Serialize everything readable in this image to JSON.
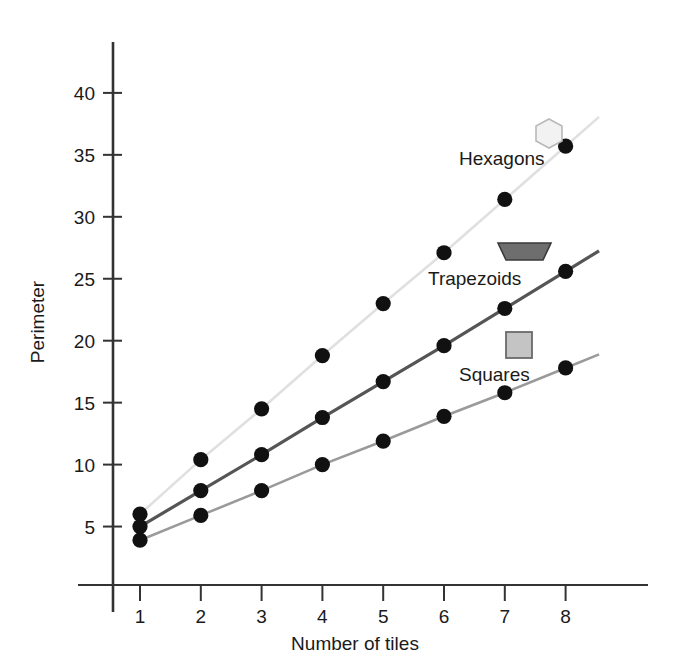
{
  "chart_data": {
    "type": "line",
    "title": "",
    "xlabel": "Number of tiles",
    "ylabel": "Perimeter",
    "x": [
      1,
      2,
      3,
      4,
      5,
      6,
      7,
      8
    ],
    "xticklabels": [
      "1",
      "2",
      "3",
      "4",
      "5",
      "6",
      "7",
      "8"
    ],
    "yticklabels": [
      "5",
      "10",
      "15",
      "20",
      "25",
      "30",
      "35",
      "40"
    ],
    "yticks": [
      5,
      10,
      15,
      20,
      25,
      30,
      35,
      40
    ],
    "xlim": [
      0.45,
      8.6
    ],
    "ylim": [
      0,
      43
    ],
    "grid": false,
    "legend_position": "inline-right",
    "series": [
      {
        "name": "Hexagons",
        "marker": "hexagon",
        "marker_fill": "#f2f2f2",
        "marker_stroke": "#b8b8b8",
        "line_color": "#e0e0e0",
        "point_color": "#111111",
        "values": [
          6.0,
          10.4,
          14.5,
          18.8,
          23.0,
          27.1,
          31.4,
          35.7
        ]
      },
      {
        "name": "Trapezoids",
        "marker": "trapezoid",
        "marker_fill": "#6e6e6e",
        "marker_stroke": "#3a3a3a",
        "line_color": "#555555",
        "point_color": "#111111",
        "values": [
          5.0,
          7.9,
          10.8,
          13.8,
          16.7,
          19.6,
          22.6,
          25.6
        ]
      },
      {
        "name": "Squares",
        "marker": "square",
        "marker_fill": "#c4c4c4",
        "marker_stroke": "#6a6a6a",
        "line_color": "#9a9a9a",
        "point_color": "#111111",
        "values": [
          3.9,
          5.9,
          7.9,
          10.0,
          11.9,
          13.9,
          15.8,
          17.8
        ]
      }
    ]
  },
  "axes": {
    "y_axis_title": "Perimeter",
    "x_axis_title": "Number of tiles",
    "axis_color": "#333333"
  },
  "legend": {
    "items": [
      {
        "label": "Hexagons",
        "shape": "hexagon-icon"
      },
      {
        "label": "Trapezoids",
        "shape": "trapezoid-icon"
      },
      {
        "label": "Squares",
        "shape": "square-icon"
      }
    ]
  },
  "ticks": {
    "y": [
      {
        "label": "40",
        "value": 40
      },
      {
        "label": "35",
        "value": 35
      },
      {
        "label": "30",
        "value": 30
      },
      {
        "label": "25",
        "value": 25
      },
      {
        "label": "20",
        "value": 20
      },
      {
        "label": "15",
        "value": 15
      },
      {
        "label": "10",
        "value": 10
      },
      {
        "label": "5",
        "value": 5
      }
    ],
    "x": [
      {
        "label": "1",
        "value": 1
      },
      {
        "label": "2",
        "value": 2
      },
      {
        "label": "3",
        "value": 3
      },
      {
        "label": "4",
        "value": 4
      },
      {
        "label": "5",
        "value": 5
      },
      {
        "label": "6",
        "value": 6
      },
      {
        "label": "7",
        "value": 7
      },
      {
        "label": "8",
        "value": 8
      }
    ]
  }
}
